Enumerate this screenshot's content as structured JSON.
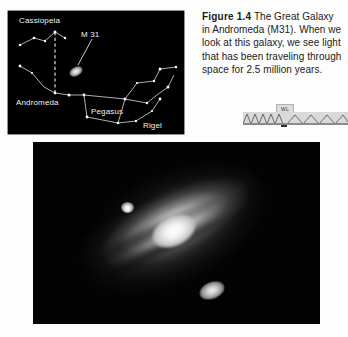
{
  "figure": {
    "number_label": "Figure 1.4",
    "caption_text": " The Great Galaxy in Andromeda (M31). When we look at this galaxy, we see light that has been traveling through space for 2.5 million years."
  },
  "star_chart": {
    "labels": {
      "cassiopeia": "Cassiopeia",
      "m31": "M 31",
      "andromeda": "Andromeda",
      "pegasus": "Pegasus",
      "rigel": "Rigel"
    },
    "background_color": "#000000",
    "label_color": "#f2f2f2",
    "line_color": "#d8d8d8"
  },
  "photograph": {
    "subject": "andromeda-galaxy-m31",
    "background_color": "#030303",
    "core_color": "#ffffff"
  },
  "artifact": {
    "tab_text": "WL"
  },
  "page": {
    "background_color": "#fdfdfd"
  }
}
